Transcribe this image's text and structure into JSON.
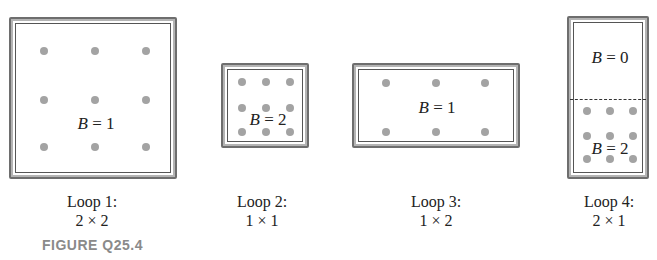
{
  "figure": {
    "title": "FIGURE Q25.4",
    "caption_color": "#8a8a8a",
    "dot_color": "#a3a3a3",
    "border_color": "#6e6e6e"
  },
  "loops": [
    {
      "name": "Loop 1:",
      "dimensions": "2 × 2",
      "fields": [
        {
          "symbol": "B",
          "eq": " = 1"
        }
      ]
    },
    {
      "name": "Loop 2:",
      "dimensions": "1 × 1",
      "fields": [
        {
          "symbol": "B",
          "eq": " = 2"
        }
      ]
    },
    {
      "name": "Loop 3:",
      "dimensions": "1 × 2",
      "fields": [
        {
          "symbol": "B",
          "eq": " = 1"
        }
      ]
    },
    {
      "name": "Loop 4:",
      "dimensions": "2 × 1",
      "fields": [
        {
          "symbol": "B",
          "eq": " = 0"
        },
        {
          "symbol": "B",
          "eq": " = 2"
        }
      ]
    }
  ]
}
